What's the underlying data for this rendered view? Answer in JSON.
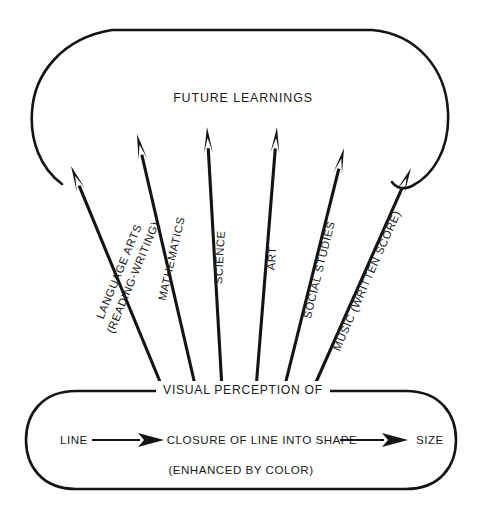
{
  "diagram": {
    "title_node": {
      "label": "FUTURE LEARNINGS",
      "x": 243,
      "y": 102
    },
    "banner": {
      "label": "VISUAL PERCEPTION OF",
      "x": 243,
      "y": 394
    },
    "note": {
      "label": "(ENHANCED BY COLOR)",
      "x": 241,
      "y": 474
    },
    "flow": {
      "start_label": "LINE",
      "middle_label": "CLOSURE OF LINE INTO SHAPE",
      "end_label": "SIZE",
      "arrow_glyph": "arrow-right"
    },
    "spokes": [
      {
        "name": "language-arts",
        "label": "LANGUAGE ARTS",
        "sublabel": "(READING-WRITING)",
        "base_x": 163,
        "base_y": 389,
        "tip_x": 71,
        "tip_y": 166,
        "angle": -67.5,
        "width": 3.1
      },
      {
        "name": "mathematics",
        "label": "MATHEMATICS",
        "sublabel": "",
        "base_x": 196,
        "base_y": 389,
        "tip_x": 137,
        "tip_y": 134,
        "angle": -77.0,
        "width": 3.1
      },
      {
        "name": "science",
        "label": "SCIENCE",
        "sublabel": "",
        "base_x": 222,
        "base_y": 389,
        "tip_x": 207,
        "tip_y": 127,
        "angle": -86.7,
        "width": 3.1
      },
      {
        "name": "art",
        "label": "ART",
        "sublabel": "",
        "base_x": 256,
        "base_y": 389,
        "tip_x": 277,
        "tip_y": 127,
        "angle": -85.4,
        "width": 3.1
      },
      {
        "name": "social-studies",
        "label": "SOCIAL STUDIES",
        "sublabel": "",
        "base_x": 284,
        "base_y": 389,
        "tip_x": 344,
        "tip_y": 148,
        "angle": -76.0,
        "width": 3.1
      },
      {
        "name": "music",
        "label": "MUSIC (WRITTEN SCORE)",
        "sublabel": "",
        "base_x": 313,
        "base_y": 389,
        "tip_x": 411,
        "tip_y": 168,
        "angle": -66.1,
        "width": 3.1
      }
    ],
    "colors": {
      "ink": "#141414",
      "text": "#1a1a1a",
      "background": "#ffffff"
    }
  }
}
